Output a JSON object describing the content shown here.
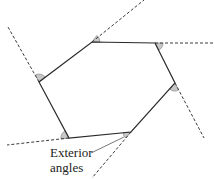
{
  "diagram": {
    "title": "",
    "type": "hexagon-exterior-angles",
    "colors": {
      "edge": "#2a2a2a",
      "dashed": "#3a3a3a",
      "angle_fill": "#c8c8c8",
      "angle_stroke": "#7a7a7a",
      "text": "#222222",
      "background": "#ffffff"
    },
    "label": {
      "line1": "Exterior",
      "line2": "angles"
    },
    "vertices": [
      {
        "id": "A",
        "x": 92,
        "y": 42
      },
      {
        "id": "B",
        "x": 155,
        "y": 43
      },
      {
        "id": "C",
        "x": 175,
        "y": 83
      },
      {
        "id": "D",
        "x": 131,
        "y": 132
      },
      {
        "id": "E",
        "x": 69,
        "y": 138
      },
      {
        "id": "F",
        "x": 39,
        "y": 82
      }
    ],
    "extensions": [
      {
        "from": "A",
        "to_x": 144,
        "to_y": 0
      },
      {
        "from": "B",
        "to_x": 214,
        "to_y": 43
      },
      {
        "from": "C",
        "to_x": 204,
        "to_y": 138
      },
      {
        "from": "D",
        "to_x": 92,
        "to_y": 178
      },
      {
        "from": "E",
        "to_x": 7,
        "to_y": 145
      },
      {
        "from": "F",
        "to_x": 8,
        "to_y": 27
      }
    ],
    "exterior_angle_count": 6
  }
}
